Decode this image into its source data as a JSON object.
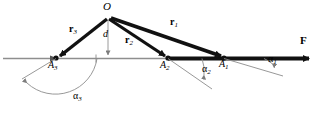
{
  "figure": {
    "axis_color": "#888888",
    "vector_color": "#111111",
    "thin_color": "#8c8c8c"
  },
  "points": [
    {
      "id": "O",
      "label": "O",
      "x": 108,
      "y": 16,
      "label_x": 104,
      "label_y": 2,
      "style": "italic"
    },
    {
      "id": "A3",
      "label": "A",
      "sub": "3",
      "x": 56,
      "y": 58,
      "label_x": 49,
      "label_y": 61
    },
    {
      "id": "A2",
      "label": "A",
      "sub": "2",
      "x": 168,
      "y": 58,
      "label_x": 161,
      "label_y": 61
    },
    {
      "id": "A1",
      "label": "A",
      "sub": "1",
      "x": 224,
      "y": 58,
      "label_x": 219,
      "label_y": 60
    }
  ],
  "vectors": [
    {
      "id": "r3",
      "label": "r",
      "sub": "3",
      "label_x": 70,
      "label_y": 25,
      "from": "O",
      "to": "A3"
    },
    {
      "id": "r2",
      "label": "r",
      "sub": "2",
      "label_x": 126,
      "label_y": 36,
      "from": "O",
      "to": "A2"
    },
    {
      "id": "r1",
      "label": "r",
      "sub": "1",
      "label_x": 170,
      "label_y": 18,
      "from": "O",
      "to": "A1"
    },
    {
      "id": "F",
      "label": "F",
      "sub": "",
      "label_x": 300,
      "label_y": 35,
      "from": "A2",
      "to": "axis-end"
    }
  ],
  "distance": {
    "label": "d",
    "label_x": 104,
    "label_y": 30,
    "from_x": 108,
    "from_y": 20,
    "to_x": 108,
    "to_y": 58
  },
  "angles": [
    {
      "id": "alpha1",
      "label": "α",
      "sub": "1",
      "label_x": 268,
      "label_y": 56
    },
    {
      "id": "alpha2",
      "label": "α",
      "sub": "2",
      "label_x": 202,
      "label_y": 65
    },
    {
      "id": "alpha3",
      "label": "α",
      "sub": "3",
      "label_x": 73,
      "label_y": 92
    }
  ]
}
